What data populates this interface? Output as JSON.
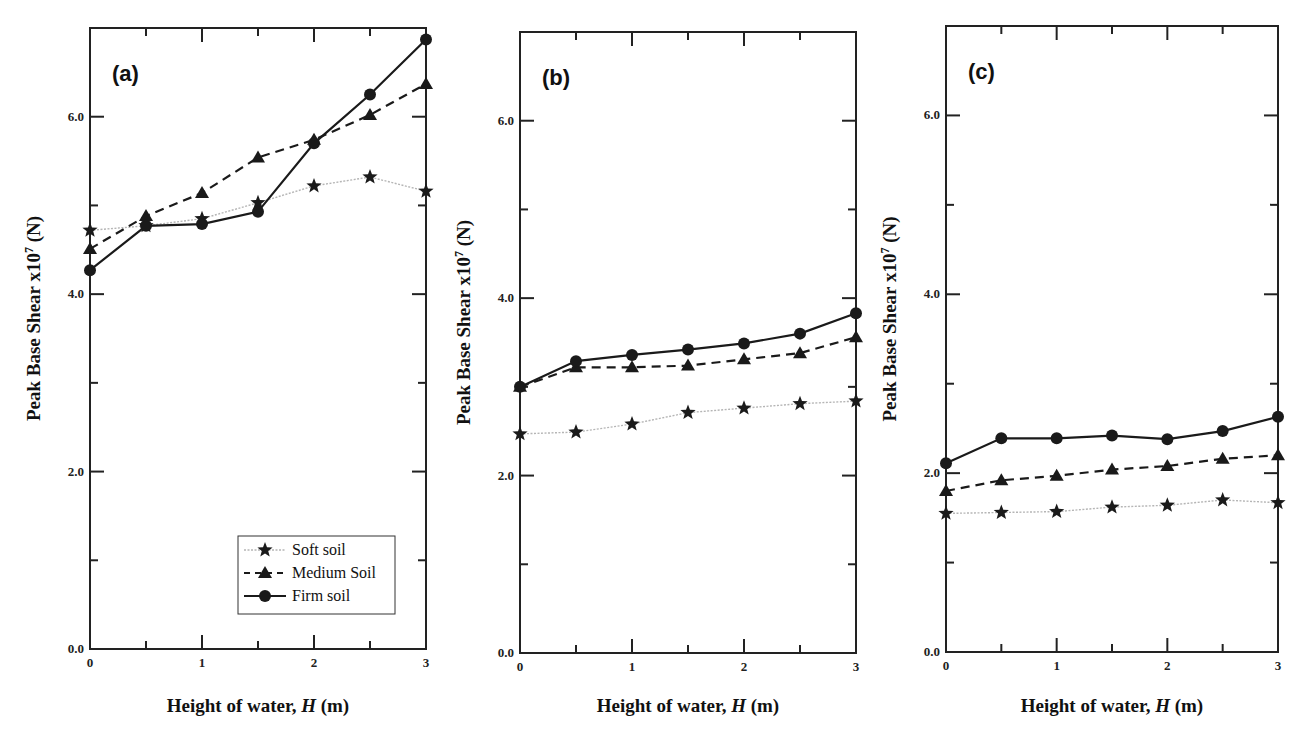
{
  "figure": {
    "x_axis_title": "Height of water, H (m)",
    "x_axis_title_prefix": "Height of water, ",
    "x_axis_title_var": "H",
    "x_axis_title_suffix": " (m)",
    "y_axis_title_prefix": "Peak Base Shear x10",
    "y_axis_title_exp": "7",
    "y_axis_title_suffix": " (N)",
    "legend": {
      "items": [
        {
          "label": "Soft soil",
          "marker": "star",
          "line": "dotted-gray"
        },
        {
          "label": "Medium Soil",
          "marker": "triangle",
          "line": "dashed-black"
        },
        {
          "label": "Firm soil",
          "marker": "circle",
          "line": "solid-black"
        }
      ]
    },
    "colors": {
      "soft_line": "#b5b5b5",
      "medium_line": "#1a1a1a",
      "firm_line": "#1a1a1a",
      "marker": "#1a1a1a",
      "axis": "#222222"
    }
  },
  "chart_data": [
    {
      "type": "line",
      "title": "(a)",
      "xlabel": "Height of water, H (m)",
      "ylabel": "Peak Base Shear x10^7 (N)",
      "x": [
        0,
        0.5,
        1,
        1.5,
        2,
        2.5,
        3
      ],
      "xlim": [
        0,
        3
      ],
      "ylim": [
        0,
        7
      ],
      "x_ticks": [
        "0",
        "1",
        "2",
        "3"
      ],
      "y_ticks": [
        "0.0",
        "2.0",
        "4.0",
        "6.0"
      ],
      "grid": false,
      "legend_position": "lower right",
      "series": [
        {
          "name": "Soft soil",
          "values": [
            4.72,
            4.77,
            4.85,
            5.03,
            5.22,
            5.32,
            5.16
          ]
        },
        {
          "name": "Medium Soil",
          "values": [
            4.51,
            4.88,
            5.14,
            5.54,
            5.74,
            6.02,
            6.37
          ]
        },
        {
          "name": "Firm soil",
          "values": [
            4.27,
            4.77,
            4.79,
            4.93,
            5.7,
            6.25,
            6.87
          ]
        }
      ]
    },
    {
      "type": "line",
      "title": "(b)",
      "xlabel": "Height of water, H (m)",
      "ylabel": "Peak Base Shear x10^7 (N)",
      "x": [
        0,
        0.5,
        1,
        1.5,
        2,
        2.5,
        3
      ],
      "xlim": [
        0,
        3
      ],
      "ylim": [
        0,
        7
      ],
      "x_ticks": [
        "0",
        "1",
        "2",
        "3"
      ],
      "y_ticks": [
        "0.0",
        "2.0",
        "4.0",
        "6.0"
      ],
      "grid": false,
      "series": [
        {
          "name": "Soft soil",
          "values": [
            2.47,
            2.49,
            2.58,
            2.71,
            2.76,
            2.81,
            2.84
          ]
        },
        {
          "name": "Medium Soil",
          "values": [
            3.0,
            3.22,
            3.22,
            3.24,
            3.31,
            3.38,
            3.56
          ]
        },
        {
          "name": "Firm soil",
          "values": [
            3.0,
            3.29,
            3.36,
            3.42,
            3.49,
            3.6,
            3.83
          ]
        }
      ]
    },
    {
      "type": "line",
      "title": "(c)",
      "xlabel": "Height of water, H (m)",
      "ylabel": "Peak Base Shear x10^7 (N)",
      "x": [
        0,
        0.5,
        1,
        1.5,
        2,
        2.5,
        3
      ],
      "xlim": [
        0,
        3
      ],
      "ylim": [
        0,
        7
      ],
      "x_ticks": [
        "0",
        "1",
        "2",
        "3"
      ],
      "y_ticks": [
        "0.0",
        "2.0",
        "4.0",
        "6.0"
      ],
      "grid": false,
      "series": [
        {
          "name": "Soft soil",
          "values": [
            1.55,
            1.56,
            1.57,
            1.62,
            1.64,
            1.7,
            1.67
          ]
        },
        {
          "name": "Medium Soil",
          "values": [
            1.8,
            1.92,
            1.97,
            2.04,
            2.08,
            2.16,
            2.2
          ]
        },
        {
          "name": "Firm soil",
          "values": [
            2.11,
            2.39,
            2.39,
            2.42,
            2.38,
            2.47,
            2.63
          ]
        }
      ]
    }
  ]
}
